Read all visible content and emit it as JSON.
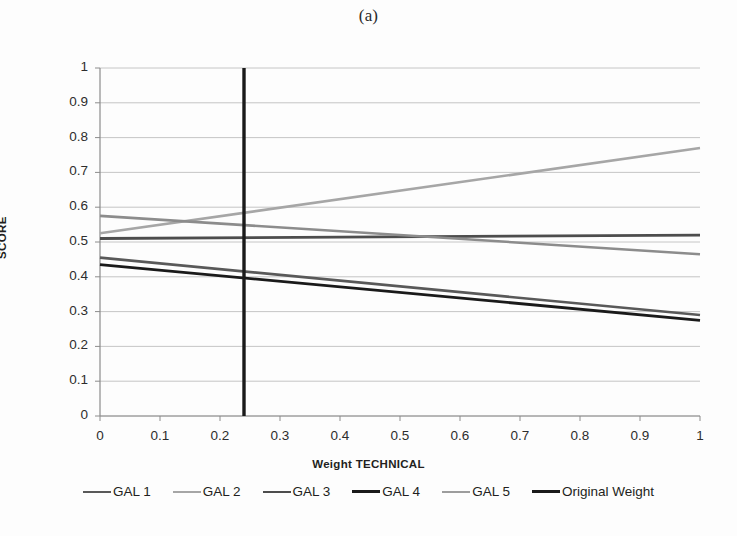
{
  "figure": {
    "caption": "(a)"
  },
  "chart_data": {
    "type": "line",
    "title": "(a)",
    "xlabel": "Weight TECHNICAL",
    "ylabel": "SCORE",
    "xlim": [
      0,
      1
    ],
    "ylim": [
      0,
      1
    ],
    "xticks": [
      "0",
      "0.1",
      "0.2",
      "0.3",
      "0.4",
      "0.5",
      "0.6",
      "0.7",
      "0.8",
      "0.9",
      "1"
    ],
    "yticks": [
      "0",
      "0.1",
      "0.2",
      "0.3",
      "0.4",
      "0.5",
      "0.6",
      "0.7",
      "0.8",
      "0.9",
      "1"
    ],
    "grid": "horizontal",
    "legend_position": "bottom",
    "x": [
      0,
      1
    ],
    "series": [
      {
        "name": "GAL 1",
        "values": [
          0.455,
          0.29
        ],
        "color": "#595959",
        "width": 2.6
      },
      {
        "name": "GAL 2",
        "values": [
          0.525,
          0.77
        ],
        "color": "#a6a6a6",
        "width": 2.6
      },
      {
        "name": "GAL 3",
        "values": [
          0.51,
          0.52
        ],
        "color": "#4d4d4d",
        "width": 2.8
      },
      {
        "name": "GAL 4",
        "values": [
          0.435,
          0.275
        ],
        "color": "#1a1a1a",
        "width": 2.8
      },
      {
        "name": "GAL 5",
        "values": [
          0.575,
          0.465
        ],
        "color": "#8c8c8c",
        "width": 2.6
      }
    ],
    "vertical_marker": {
      "name": "Original Weight",
      "x": 0.24,
      "y_from": 0,
      "y_to": 1,
      "color": "#1a1a1a",
      "width": 3.4
    },
    "annotations": []
  },
  "legend": {
    "items": [
      {
        "label": "GAL 1",
        "color": "#595959",
        "width": 2.6
      },
      {
        "label": "GAL 2",
        "color": "#a6a6a6",
        "width": 2.6
      },
      {
        "label": "GAL 3",
        "color": "#4d4d4d",
        "width": 2.8
      },
      {
        "label": "GAL 4",
        "color": "#1a1a1a",
        "width": 3.0
      },
      {
        "label": "GAL 5",
        "color": "#9d9d9d",
        "width": 2.2
      },
      {
        "label": "Original Weight",
        "color": "#1a1a1a",
        "width": 3.6
      }
    ]
  },
  "colors": {
    "background": "#fdfdfd",
    "axis": "#8c8c8c",
    "gridline": "#bfbfbf",
    "text": "#231f20"
  }
}
